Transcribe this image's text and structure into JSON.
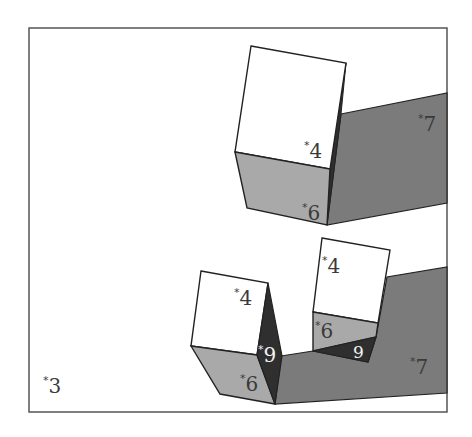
{
  "diagram": {
    "colors": {
      "background": "#ffffff",
      "frame": "#555555",
      "outline": "#222222",
      "top_face": "#ffffff",
      "front_face": "#a9a9a9",
      "shadow_band": "#7b7b7b",
      "dark_face": "#2f2f2f",
      "label_dark": "#3a3a3a",
      "label_light": "#f2f2f2"
    },
    "labels": {
      "upper_cube_top": "4",
      "upper_cube_front": "6",
      "upper_band": "7",
      "lower_left_cube_top": "4",
      "lower_left_cube_front": "6",
      "lower_left_cube_side": "9",
      "lower_right_cube_top": "4",
      "lower_right_cube_front": "6",
      "lower_right_cube_bottom": "9",
      "lower_band": "7",
      "background": "3"
    },
    "asterisk": "*"
  }
}
